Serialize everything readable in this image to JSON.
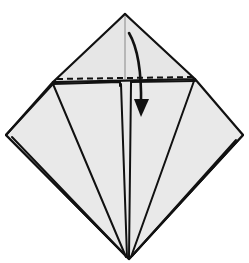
{
  "diagram": {
    "instruction": "valley fold top triangle down along dashed line",
    "colors": {
      "paper": "#e6e6e6",
      "line": "#111111",
      "background": "#ffffff"
    },
    "elements": [
      {
        "name": "kite-outline",
        "type": "paper-shape"
      },
      {
        "name": "top-triangle-flap",
        "type": "flap"
      },
      {
        "name": "dashed-fold-line",
        "type": "valley-fold-line"
      },
      {
        "name": "center-crease-lines",
        "type": "crease"
      },
      {
        "name": "side-flap-edges",
        "type": "crease"
      },
      {
        "name": "fold-down-arrow",
        "type": "arrow",
        "direction": "down"
      }
    ]
  }
}
